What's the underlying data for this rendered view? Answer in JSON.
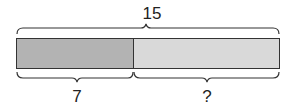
{
  "diagram": {
    "type": "tape-diagram",
    "total_label": "15",
    "parts": [
      {
        "label": "7",
        "color": "#b3b3b3"
      },
      {
        "label": "?",
        "color": "#d9d9d9"
      }
    ],
    "border_color": "#333333"
  }
}
